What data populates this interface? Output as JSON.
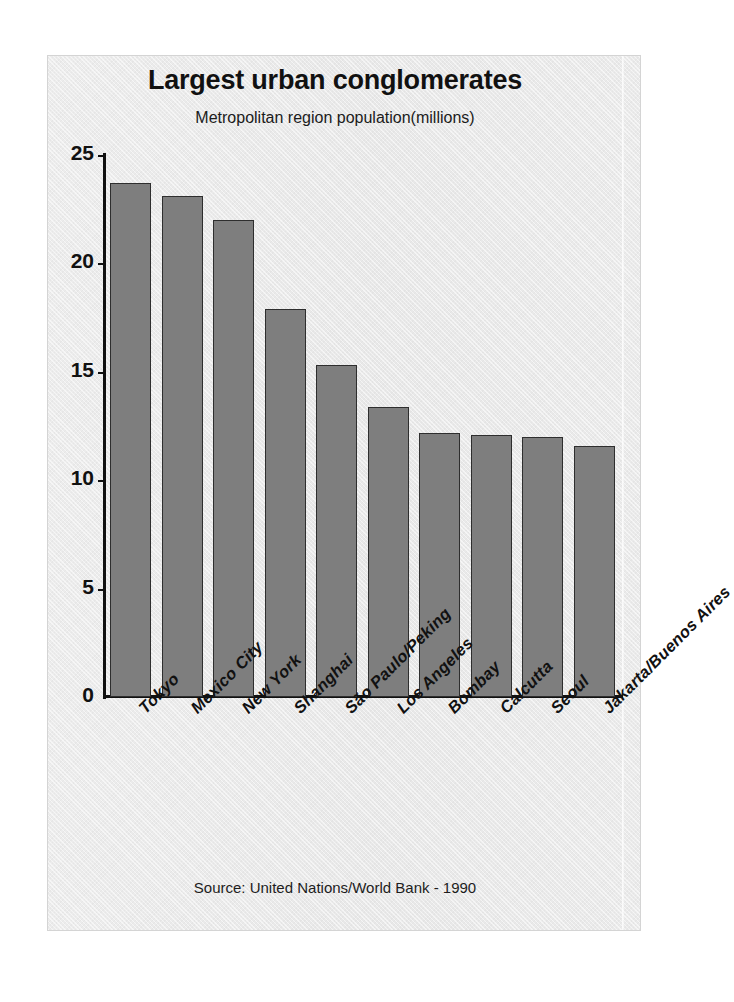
{
  "chart_data": {
    "type": "bar",
    "title": "Largest urban conglomerates",
    "subtitle": "Metropolitan region population(millions)",
    "xlabel": "",
    "ylabel": "",
    "ylim": [
      0,
      25
    ],
    "ytick_labels": [
      "25",
      "20",
      "15",
      "10",
      "5",
      "0"
    ],
    "ytick_values": [
      25,
      20,
      15,
      10,
      5,
      0
    ],
    "grid": false,
    "legend": "none",
    "source": "Source: United Nations/World Bank - 1990",
    "categories": [
      "Tokyo",
      "Mexico City",
      "New York",
      "Shanghai",
      "São Paulo/Peking",
      "Los Angeles",
      "Bombay",
      "Calcutta",
      "Seoul",
      "Jakarta/Buenos Aires"
    ],
    "values": [
      23.7,
      23.1,
      22.0,
      17.9,
      15.3,
      13.4,
      12.2,
      12.1,
      12.0,
      11.6
    ],
    "bar_color": "#7e7e7e",
    "bar_edge_color": "#2e2e2e",
    "axis_color": "#111111",
    "panel_color": "#e9e9e9"
  }
}
